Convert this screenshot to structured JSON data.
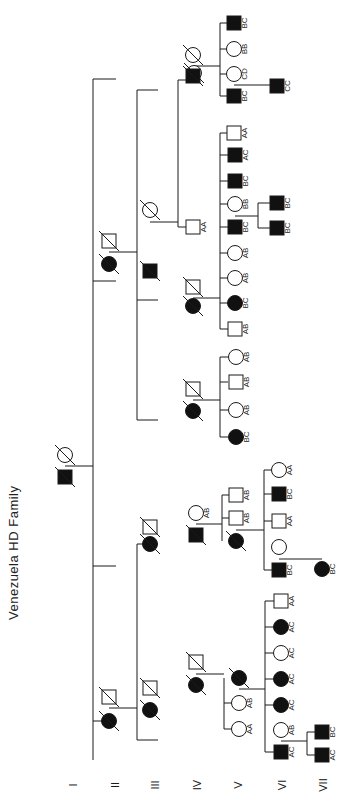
{
  "title": "Venezuela HD Family",
  "colors": {
    "ink": "#1a1a1a",
    "affected": "#111111",
    "background": "#ffffff"
  },
  "generations": [
    {
      "label": "I",
      "x": 73,
      "y": 785
    },
    {
      "label": "II",
      "x": 115,
      "y": 785
    },
    {
      "label": "III",
      "x": 155,
      "y": 785
    },
    {
      "label": "IV",
      "x": 197,
      "y": 785
    },
    {
      "label": "V",
      "x": 238,
      "y": 785
    },
    {
      "label": "VI",
      "x": 282,
      "y": 785
    },
    {
      "label": "VII",
      "x": 323,
      "y": 785
    }
  ],
  "individuals": [
    {
      "id": "I-1",
      "sex": "female",
      "affected": false,
      "deceased": true,
      "x": 65,
      "y": 455,
      "label": ""
    },
    {
      "id": "I-2",
      "sex": "male",
      "affected": true,
      "deceased": true,
      "x": 65,
      "y": 477,
      "label": ""
    },
    {
      "id": "II-1",
      "sex": "male",
      "affected": false,
      "deceased": true,
      "x": 109,
      "y": 241,
      "label": ""
    },
    {
      "id": "II-2",
      "sex": "female",
      "affected": true,
      "deceased": true,
      "x": 109,
      "y": 264,
      "label": ""
    },
    {
      "id": "II-3",
      "sex": "male",
      "affected": false,
      "deceased": true,
      "x": 109,
      "y": 697,
      "label": ""
    },
    {
      "id": "II-4",
      "sex": "female",
      "affected": true,
      "deceased": true,
      "x": 109,
      "y": 721,
      "label": ""
    },
    {
      "id": "III-1",
      "sex": "female",
      "affected": false,
      "deceased": true,
      "x": 150,
      "y": 210,
      "label": ""
    },
    {
      "id": "III-2",
      "sex": "male",
      "affected": true,
      "deceased": true,
      "x": 150,
      "y": 271,
      "label": ""
    },
    {
      "id": "III-3",
      "sex": "female",
      "affected": false,
      "deceased": true,
      "x": 194,
      "y": 73,
      "label": ""
    },
    {
      "id": "III-4",
      "sex": "male",
      "affected": true,
      "deceased": true,
      "x": 194,
      "y": 76,
      "label": "",
      "skip": true
    },
    {
      "id": "III-5",
      "sex": "male",
      "affected": false,
      "deceased": true,
      "x": 150,
      "y": 527,
      "label": ""
    },
    {
      "id": "III-6",
      "sex": "female",
      "affected": true,
      "deceased": true,
      "x": 150,
      "y": 544,
      "label": ""
    },
    {
      "id": "III-7",
      "sex": "male",
      "affected": false,
      "deceased": true,
      "x": 150,
      "y": 688,
      "label": ""
    },
    {
      "id": "III-8",
      "sex": "female",
      "affected": true,
      "deceased": true,
      "x": 150,
      "y": 710,
      "label": ""
    },
    {
      "id": "IV-a1",
      "sex": "female",
      "affected": false,
      "deceased": true,
      "x": 193,
      "y": 55,
      "label": ""
    },
    {
      "id": "IV-a2",
      "sex": "male",
      "affected": true,
      "deceased": true,
      "x": 193,
      "y": 76,
      "label": ""
    },
    {
      "id": "IV-b1",
      "sex": "male",
      "affected": false,
      "deceased": false,
      "x": 193,
      "y": 227,
      "label": "AA"
    },
    {
      "id": "IV-c1",
      "sex": "male",
      "affected": false,
      "deceased": true,
      "x": 193,
      "y": 287,
      "label": ""
    },
    {
      "id": "IV-c2",
      "sex": "female",
      "affected": true,
      "deceased": true,
      "x": 193,
      "y": 306,
      "label": ""
    },
    {
      "id": "IV-d1",
      "sex": "male",
      "affected": false,
      "deceased": true,
      "x": 193,
      "y": 389,
      "label": ""
    },
    {
      "id": "IV-d2",
      "sex": "female",
      "affected": true,
      "deceased": true,
      "x": 193,
      "y": 411,
      "label": ""
    },
    {
      "id": "IV-e1",
      "sex": "female",
      "affected": false,
      "deceased": false,
      "x": 196,
      "y": 513,
      "label": "AB"
    },
    {
      "id": "IV-e2",
      "sex": "male",
      "affected": true,
      "deceased": true,
      "x": 196,
      "y": 535,
      "label": ""
    },
    {
      "id": "IV-f1",
      "sex": "male",
      "affected": false,
      "deceased": true,
      "x": 196,
      "y": 662,
      "label": ""
    },
    {
      "id": "IV-f2",
      "sex": "female",
      "affected": true,
      "deceased": true,
      "x": 196,
      "y": 685,
      "label": ""
    },
    {
      "id": "V-a1",
      "sex": "male",
      "affected": true,
      "deceased": false,
      "x": 234,
      "y": 23,
      "label": "BC"
    },
    {
      "id": "V-a2",
      "sex": "female",
      "affected": false,
      "deceased": false,
      "x": 234,
      "y": 49,
      "label": "BB"
    },
    {
      "id": "V-a3",
      "sex": "female",
      "affected": false,
      "deceased": false,
      "x": 234,
      "y": 74,
      "label": "CD"
    },
    {
      "id": "V-a4",
      "sex": "male",
      "affected": true,
      "deceased": false,
      "x": 234,
      "y": 96,
      "label": "BC"
    },
    {
      "id": "V-c1",
      "sex": "male",
      "affected": false,
      "deceased": false,
      "x": 234,
      "y": 133,
      "label": "AA"
    },
    {
      "id": "V-c2",
      "sex": "male",
      "affected": true,
      "deceased": false,
      "x": 235,
      "y": 155,
      "label": "AC"
    },
    {
      "id": "V-c3",
      "sex": "male",
      "affected": true,
      "deceased": false,
      "x": 235,
      "y": 181,
      "label": "BC"
    },
    {
      "id": "V-c4",
      "sex": "female",
      "affected": false,
      "deceased": false,
      "x": 235,
      "y": 204,
      "label": "BB"
    },
    {
      "id": "V-c5",
      "sex": "male",
      "affected": true,
      "deceased": false,
      "x": 235,
      "y": 227,
      "label": "BC"
    },
    {
      "id": "V-c6",
      "sex": "female",
      "affected": false,
      "deceased": false,
      "x": 235,
      "y": 253,
      "label": "AB"
    },
    {
      "id": "V-c7",
      "sex": "female",
      "affected": false,
      "deceased": false,
      "x": 235,
      "y": 278,
      "label": "AB"
    },
    {
      "id": "V-c8",
      "sex": "female",
      "affected": true,
      "deceased": false,
      "x": 235,
      "y": 303,
      "label": "BC"
    },
    {
      "id": "V-c9",
      "sex": "male",
      "affected": false,
      "deceased": false,
      "x": 235,
      "y": 329,
      "label": "AB"
    },
    {
      "id": "V-d1",
      "sex": "female",
      "affected": false,
      "deceased": false,
      "x": 236,
      "y": 357,
      "label": "AB"
    },
    {
      "id": "V-d2",
      "sex": "male",
      "affected": false,
      "deceased": false,
      "x": 236,
      "y": 382,
      "label": "AB"
    },
    {
      "id": "V-d3",
      "sex": "female",
      "affected": false,
      "deceased": false,
      "x": 236,
      "y": 410,
      "label": "AB"
    },
    {
      "id": "V-d4",
      "sex": "female",
      "affected": true,
      "deceased": false,
      "x": 236,
      "y": 437,
      "label": "BC"
    },
    {
      "id": "V-e1",
      "sex": "male",
      "affected": false,
      "deceased": false,
      "x": 236,
      "y": 495,
      "label": "AB"
    },
    {
      "id": "V-e2",
      "sex": "male",
      "affected": false,
      "deceased": false,
      "x": 236,
      "y": 518,
      "label": "AB"
    },
    {
      "id": "V-e3",
      "sex": "female",
      "affected": true,
      "deceased": true,
      "x": 236,
      "y": 541,
      "label": ""
    },
    {
      "id": "V-f1",
      "sex": "female",
      "affected": true,
      "deceased": true,
      "x": 239,
      "y": 678,
      "label": ""
    },
    {
      "id": "V-f2",
      "sex": "female",
      "affected": false,
      "deceased": false,
      "x": 239,
      "y": 703,
      "label": "AB"
    },
    {
      "id": "V-f3",
      "sex": "female",
      "affected": false,
      "deceased": false,
      "x": 239,
      "y": 729,
      "label": "AA"
    },
    {
      "id": "VI-a1",
      "sex": "male",
      "affected": true,
      "deceased": false,
      "x": 277,
      "y": 86,
      "label": "CC"
    },
    {
      "id": "VI-c1",
      "sex": "male",
      "affected": true,
      "deceased": false,
      "x": 277,
      "y": 203,
      "label": "BC"
    },
    {
      "id": "VI-c2",
      "sex": "male",
      "affected": true,
      "deceased": false,
      "x": 277,
      "y": 228,
      "label": "BC"
    },
    {
      "id": "VI-e1",
      "sex": "female",
      "affected": false,
      "deceased": false,
      "x": 279,
      "y": 470,
      "label": "AA"
    },
    {
      "id": "VI-e2",
      "sex": "male",
      "affected": true,
      "deceased": false,
      "x": 279,
      "y": 494,
      "label": "BC"
    },
    {
      "id": "VI-e3",
      "sex": "male",
      "affected": false,
      "deceased": false,
      "x": 279,
      "y": 521,
      "label": "AA"
    },
    {
      "id": "VI-e4",
      "sex": "female",
      "affected": false,
      "deceased": false,
      "x": 279,
      "y": 547,
      "label": ""
    },
    {
      "id": "VI-e5",
      "sex": "male",
      "affected": true,
      "deceased": false,
      "x": 279,
      "y": 570,
      "label": "BC"
    },
    {
      "id": "VI-f1",
      "sex": "male",
      "affected": false,
      "deceased": false,
      "x": 281,
      "y": 601,
      "label": "AA"
    },
    {
      "id": "VI-f2",
      "sex": "female",
      "affected": true,
      "deceased": false,
      "x": 281,
      "y": 627,
      "label": "AC"
    },
    {
      "id": "VI-f3",
      "sex": "female",
      "affected": false,
      "deceased": false,
      "x": 281,
      "y": 653,
      "label": "AC"
    },
    {
      "id": "VI-f4",
      "sex": "female",
      "affected": true,
      "deceased": false,
      "x": 281,
      "y": 679,
      "label": "AC"
    },
    {
      "id": "VI-f5",
      "sex": "female",
      "affected": true,
      "deceased": false,
      "x": 281,
      "y": 705,
      "label": "AC"
    },
    {
      "id": "VI-f6",
      "sex": "female",
      "affected": false,
      "deceased": false,
      "x": 281,
      "y": 730,
      "label": "AB"
    },
    {
      "id": "VI-f7",
      "sex": "male",
      "affected": true,
      "deceased": false,
      "x": 281,
      "y": 752,
      "label": "AC"
    },
    {
      "id": "VII-e1",
      "sex": "female",
      "affected": true,
      "deceased": false,
      "x": 322,
      "y": 569,
      "label": "BC"
    },
    {
      "id": "VII-f1",
      "sex": "male",
      "affected": true,
      "deceased": false,
      "x": 322,
      "y": 732,
      "label": "BC"
    },
    {
      "id": "VII-f2",
      "sex": "male",
      "affected": true,
      "deceased": false,
      "x": 322,
      "y": 755,
      "label": "AC"
    }
  ],
  "lines": [
    [
      65,
      466,
      93,
      466
    ],
    [
      93,
      79,
      93,
      760
    ],
    [
      93,
      79,
      116,
      79
    ],
    [
      93,
      281,
      116,
      281
    ],
    [
      93,
      566,
      116,
      566
    ],
    [
      93,
      721,
      116,
      721
    ],
    [
      109,
      252,
      137,
      252
    ],
    [
      137,
      90,
      137,
      420
    ],
    [
      137,
      90,
      158,
      90
    ],
    [
      137,
      300,
      158,
      300
    ],
    [
      137,
      420,
      158,
      420
    ],
    [
      150,
      222,
      178,
      222
    ],
    [
      178,
      80,
      178,
      227
    ],
    [
      178,
      80,
      188,
      80
    ],
    [
      178,
      227,
      188,
      227
    ],
    [
      109,
      708,
      137,
      708
    ],
    [
      137,
      544,
      137,
      740
    ],
    [
      137,
      544,
      158,
      544
    ],
    [
      137,
      740,
      158,
      740
    ],
    [
      193,
      66,
      220,
      66
    ],
    [
      220,
      23,
      220,
      96
    ],
    [
      220,
      23,
      228,
      23
    ],
    [
      220,
      49,
      228,
      49
    ],
    [
      220,
      74,
      228,
      74
    ],
    [
      220,
      96,
      228,
      96
    ],
    [
      193,
      298,
      220,
      298
    ],
    [
      220,
      133,
      220,
      329
    ],
    [
      220,
      133,
      228,
      133
    ],
    [
      220,
      155,
      228,
      155
    ],
    [
      220,
      181,
      228,
      181
    ],
    [
      220,
      204,
      228,
      204
    ],
    [
      220,
      227,
      228,
      227
    ],
    [
      220,
      253,
      228,
      253
    ],
    [
      220,
      278,
      228,
      278
    ],
    [
      220,
      303,
      228,
      303
    ],
    [
      220,
      329,
      228,
      329
    ],
    [
      193,
      400,
      220,
      400
    ],
    [
      220,
      357,
      220,
      437
    ],
    [
      220,
      357,
      228,
      357
    ],
    [
      220,
      382,
      228,
      382
    ],
    [
      220,
      410,
      228,
      410
    ],
    [
      220,
      437,
      228,
      437
    ],
    [
      196,
      524,
      222,
      524
    ],
    [
      222,
      495,
      222,
      541
    ],
    [
      222,
      495,
      229,
      495
    ],
    [
      222,
      518,
      229,
      518
    ],
    [
      196,
      674,
      224,
      674
    ],
    [
      224,
      678,
      224,
      729
    ],
    [
      224,
      729,
      232,
      729
    ],
    [
      224,
      703,
      232,
      703
    ],
    [
      234,
      85,
      277,
      85
    ],
    [
      235,
      216,
      258,
      216
    ],
    [
      258,
      203,
      258,
      228
    ],
    [
      258,
      203,
      270,
      203
    ],
    [
      258,
      228,
      270,
      228
    ],
    [
      236,
      530,
      264,
      530
    ],
    [
      264,
      470,
      264,
      570
    ],
    [
      264,
      470,
      272,
      470
    ],
    [
      264,
      494,
      272,
      494
    ],
    [
      264,
      521,
      272,
      521
    ],
    [
      264,
      570,
      272,
      570
    ],
    [
      279,
      559,
      322,
      559
    ],
    [
      239,
      689,
      265,
      689
    ],
    [
      265,
      601,
      265,
      752
    ],
    [
      265,
      601,
      274,
      601
    ],
    [
      265,
      627,
      274,
      627
    ],
    [
      265,
      653,
      274,
      653
    ],
    [
      265,
      679,
      274,
      679
    ],
    [
      265,
      705,
      274,
      705
    ],
    [
      265,
      752,
      274,
      752
    ],
    [
      281,
      741,
      307,
      741
    ],
    [
      307,
      732,
      307,
      755
    ],
    [
      307,
      732,
      315,
      732
    ],
    [
      307,
      755,
      315,
      755
    ]
  ]
}
